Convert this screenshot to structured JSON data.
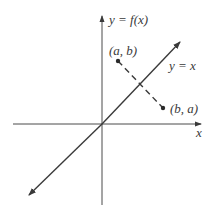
{
  "diagram": {
    "type": "reflection-about-line-y-equals-x",
    "labels": {
      "y_axis": "y = f(x)",
      "x_axis": "x",
      "diagonal": "y = x",
      "point_ab": "(a, b)",
      "point_ba": "(b, a)"
    },
    "geometry": {
      "origin": [
        102,
        124
      ],
      "x_axis": {
        "from": [
          13,
          124
        ],
        "to": [
          202,
          124
        ]
      },
      "y_axis": {
        "from": [
          102,
          205
        ],
        "to": [
          102,
          15
        ]
      },
      "diagonal": {
        "from": [
          28,
          196
        ],
        "to": [
          181,
          41
        ]
      },
      "point_ab": [
        118,
        61
      ],
      "point_ba": [
        163,
        108
      ]
    },
    "colors": {
      "stroke": "#3a3a3a",
      "background": "#ffffff"
    }
  }
}
